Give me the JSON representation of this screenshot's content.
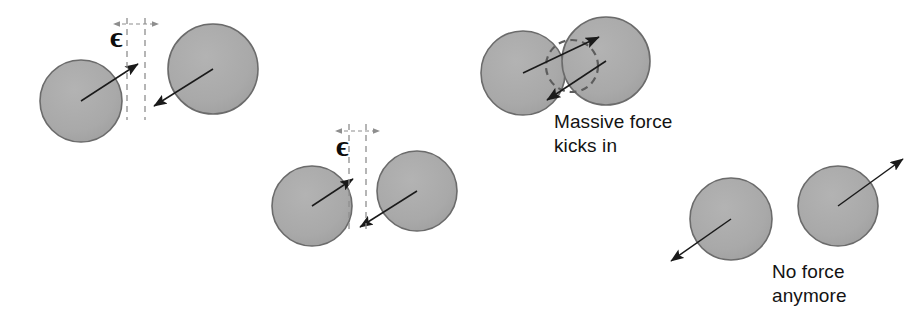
{
  "figure": {
    "background_color": "#ffffff",
    "width": 920,
    "height": 326,
    "particle_fill": "#a9a9a9",
    "particle_stroke": "#6b6b6b",
    "arrow_color": "#1a1a1a",
    "dashed_color": "#8e8e8e",
    "text_color": "#131313"
  },
  "labels": {
    "epsilon_symbol_1": "ϵ",
    "epsilon_symbol_2": "ϵ",
    "massive_force": "Massive force\nkicks in",
    "no_force": "No force\nanymore"
  },
  "panels": [
    {
      "id": "panel-approaching",
      "description": "Two particles approaching, separated by gap epsilon",
      "particles": [
        {
          "name": "particle-left",
          "cx": 81,
          "cy": 101,
          "r": 41,
          "velocity": {
            "from": [
              81,
              101
            ],
            "to": [
              140,
              63
            ]
          }
        },
        {
          "name": "particle-right",
          "cx": 213,
          "cy": 69,
          "r": 45,
          "velocity": {
            "from": [
              213,
              69
            ],
            "to": [
              152,
              107
            ]
          }
        }
      ],
      "gap_marker": {
        "name": "epsilon-gap-1",
        "line_x1": 127,
        "line_x2": 145,
        "line_top": 18,
        "line_bottom": 120,
        "tick_y": 24,
        "label": "ϵ"
      }
    },
    {
      "id": "panel-contact",
      "description": "Particles just touching at separation epsilon",
      "particles": [
        {
          "name": "particle-left",
          "cx": 312,
          "cy": 206,
          "r": 40,
          "velocity": {
            "from": [
              312,
              206
            ],
            "to": [
              355,
              178
            ]
          }
        },
        {
          "name": "particle-right",
          "cx": 417,
          "cy": 191,
          "r": 40,
          "velocity": {
            "from": [
              417,
              191
            ],
            "to": [
              358,
              229
            ]
          }
        }
      ],
      "gap_marker": {
        "name": "epsilon-gap-2",
        "line_x1": 349,
        "line_x2": 366,
        "line_top": 124,
        "line_bottom": 232,
        "tick_y": 131,
        "label": "ϵ"
      }
    },
    {
      "id": "panel-overlap",
      "description": "Particles overlapping; repulsive contact force active",
      "particles": [
        {
          "name": "particle-left",
          "cx": 523,
          "cy": 73,
          "r": 42,
          "force": {
            "from": [
              523,
              73
            ],
            "to": [
              601,
              35
            ]
          }
        },
        {
          "name": "particle-right",
          "cx": 606,
          "cy": 61,
          "r": 44,
          "force": {
            "from": [
              606,
              61
            ],
            "to": [
              545,
              102
            ]
          }
        }
      ],
      "overlap_circle": {
        "name": "overlap-region",
        "cx": 572,
        "cy": 66,
        "r": 26
      },
      "caption": "Massive force\nkicks in"
    },
    {
      "id": "panel-separating",
      "description": "Particles have separated; no contact force",
      "particles": [
        {
          "name": "particle-left",
          "cx": 731,
          "cy": 219,
          "r": 41,
          "velocity": {
            "from": [
              731,
              219
            ],
            "to": [
              669,
              263
            ]
          }
        },
        {
          "name": "particle-right",
          "cx": 838,
          "cy": 206,
          "r": 40,
          "velocity": {
            "from": [
              838,
              206
            ],
            "to": [
              905,
              157
            ]
          }
        }
      ],
      "caption": "No force\nanymore"
    }
  ]
}
